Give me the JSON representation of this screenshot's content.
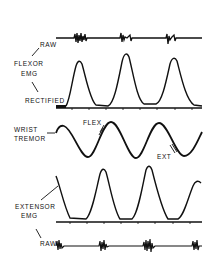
{
  "figure": {
    "labels": {
      "flexor_raw": "RAW",
      "flexor_title_1": "FLEXOR",
      "flexor_title_2": "EMG",
      "flexor_rectified": "RECTIFIED",
      "tremor_title_1": "WRIST",
      "tremor_title_2": "TREMOR",
      "flex": "FLEX",
      "ext": "EXT",
      "extensor_title_1": "EXTENSOR",
      "extensor_title_2": "EMG",
      "extensor_raw": "RAW"
    },
    "colors": {
      "ink": "#111111",
      "background": "#ffffff"
    },
    "traces": {
      "flexor_raw": {
        "y": 38,
        "x_start": 56,
        "x_end": 202,
        "bursts_x": [
          80,
          124,
          171
        ]
      },
      "flexor_rectified": {
        "baseline_y": 108,
        "peaks": [
          {
            "x": 79,
            "y": 62
          },
          {
            "x": 127,
            "y": 54
          },
          {
            "x": 174,
            "y": 59
          }
        ]
      },
      "wrist_tremor": {
        "peaks": [
          {
            "x": 63,
            "y": 126
          },
          {
            "x": 111,
            "y": 122
          },
          {
            "x": 159,
            "y": 123
          }
        ],
        "troughs": [
          {
            "x": 88,
            "y": 157
          },
          {
            "x": 136,
            "y": 158
          },
          {
            "x": 184,
            "y": 156
          }
        ]
      },
      "extensor_rectified": {
        "baseline_y": 222,
        "peaks": [
          {
            "x": 103,
            "y": 170
          },
          {
            "x": 148,
            "y": 167
          },
          {
            "x": 198,
            "y": 183
          }
        ]
      },
      "extensor_raw": {
        "y": 246,
        "x_start": 56,
        "x_end": 202,
        "bursts_x": [
          60,
          103,
          150,
          197
        ]
      }
    }
  }
}
